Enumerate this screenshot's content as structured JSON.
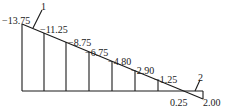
{
  "diagram": {
    "type": "moment-diagram",
    "ordinates": [
      {
        "label": "−13.75",
        "x": 22,
        "top": 24
      },
      {
        "label": "−11.25",
        "x": 44,
        "top": 37
      },
      {
        "label": "−8.75",
        "x": 66,
        "top": 49
      },
      {
        "label": "−6.75",
        "x": 89,
        "top": 59
      },
      {
        "label": "−4.80",
        "x": 112,
        "top": 68
      },
      {
        "label": "−2.90",
        "x": 135,
        "top": 77
      },
      {
        "label": "−1.25",
        "x": 158,
        "top": 86
      }
    ],
    "end_labels": {
      "crossing": "0.25",
      "right_end": "2.00"
    },
    "callouts": {
      "left": "1",
      "right": "2"
    }
  }
}
